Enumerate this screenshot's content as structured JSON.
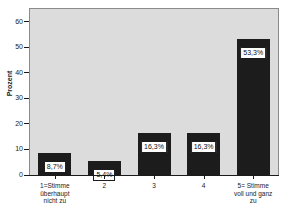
{
  "chart_data": {
    "type": "bar",
    "title": "",
    "subtitle": "",
    "xlabel": "",
    "ylabel": "Prozent",
    "categories": [
      "1=Stimme\nüberhaupt\nnicht zu",
      "2",
      "3",
      "4",
      "5= Stimme\nvoll und ganz\nzu"
    ],
    "values": [
      8.7,
      5.4,
      16.3,
      16.3,
      53.3
    ],
    "value_labels": [
      "8,7%",
      "5,4%",
      "16,3%",
      "16,3%",
      "53,3%"
    ],
    "ylim": [
      0,
      65
    ],
    "yticks": [
      0,
      10,
      20,
      30,
      40,
      50,
      60
    ],
    "ytick_labels": [
      "0",
      "10",
      "20",
      "30",
      "40",
      "50",
      "60"
    ],
    "grid": false,
    "legend": null,
    "colors": {
      "bar": "#1c1c1c",
      "plot_background": "#dcdcdc",
      "figure_background": "#ffffff",
      "axis": "#1a1a1a",
      "label_box_background": "#ffffff"
    }
  }
}
